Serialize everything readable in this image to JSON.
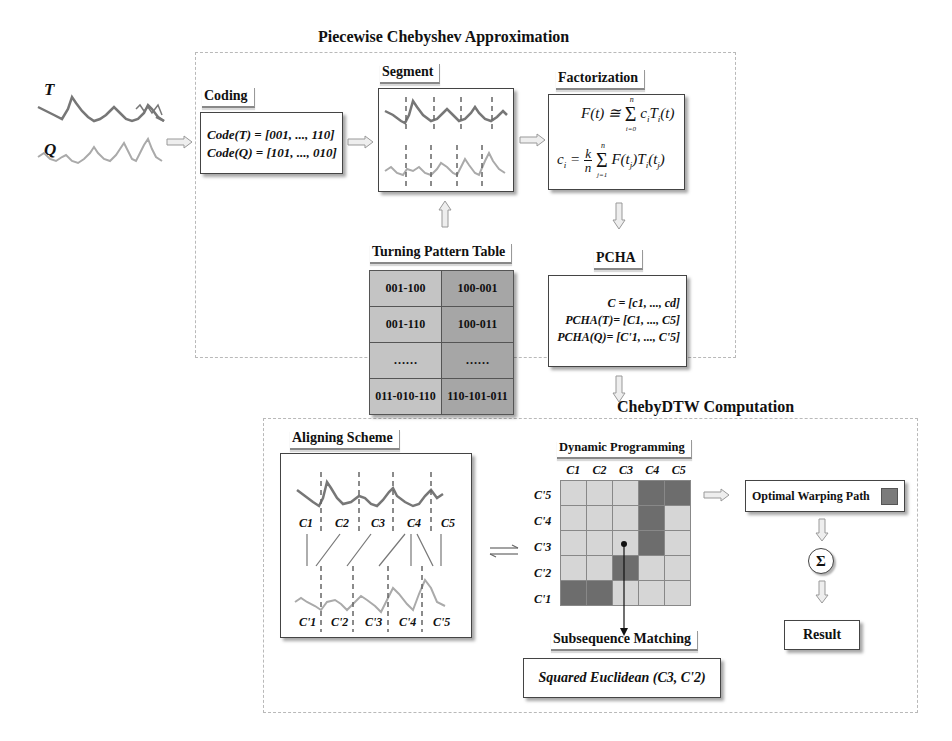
{
  "diagram": {
    "top_section_title": "Piecewise Chebyshev Approximation",
    "bottom_section_title": "ChebyDTW Computation",
    "inputs": {
      "series_T_label": "T",
      "series_Q_label": "Q"
    },
    "coding": {
      "label": "Coding",
      "line1": "Code(T) = [001, ..., 110]",
      "line2": "Code(Q) = [101, ..., 010]"
    },
    "segment": {
      "label": "Segment"
    },
    "factorization": {
      "label": "Factorization",
      "formula1": "F(t) ≅ Σ_{i=0}^{n} c_i T_i(t)",
      "formula2": "c_i = (k/n) Σ_{j=1}^{n} F(t_j) T_i(t_j)"
    },
    "turning_pattern_table": {
      "label": "Turning Pattern Table",
      "rows": [
        [
          "001-100",
          "100-001"
        ],
        [
          "001-110",
          "100-011"
        ],
        [
          "……",
          "……"
        ],
        [
          "011-010-110",
          "110-101-011"
        ]
      ]
    },
    "pcha": {
      "label": "PCHA",
      "line1": "C = [c1, ..., cd]",
      "line2": "PCHA(T)= [C1, ..., C5]",
      "line3": "PCHA(Q)= [C'1, ..., C'5]"
    },
    "aligning_scheme": {
      "label": "Aligning Scheme",
      "top_segments": [
        "C1",
        "C2",
        "C3",
        "C4",
        "C5"
      ],
      "bottom_segments": [
        "C'1",
        "C'2",
        "C'3",
        "C'4",
        "C'5"
      ]
    },
    "dynamic_programming": {
      "label": "Dynamic Programming",
      "columns": [
        "C1",
        "C2",
        "C3",
        "C4",
        "C5"
      ],
      "rows": [
        "C'5",
        "C'4",
        "C'3",
        "C'2",
        "C'1"
      ],
      "path_cells": [
        [
          0,
          3
        ],
        [
          0,
          4
        ],
        [
          1,
          3
        ],
        [
          2,
          3
        ],
        [
          3,
          2
        ],
        [
          4,
          0
        ],
        [
          4,
          1
        ]
      ],
      "cell_color": "#d6d6d6",
      "path_color": "#6d6d6d"
    },
    "optimal_warping_path": {
      "label": "Optimal Warping Path"
    },
    "sum_symbol": "Σ",
    "result": {
      "label": "Result"
    },
    "subsequence_matching": {
      "label": "Subsequence Matching",
      "value": "Squared Euclidean (C3, C'2)"
    }
  }
}
